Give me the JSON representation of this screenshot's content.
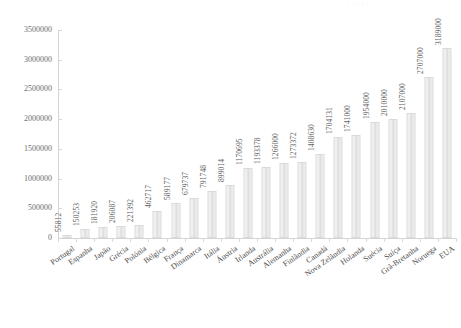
{
  "chart_data": {
    "type": "bar",
    "title": "",
    "xlabel": "",
    "ylabel": "",
    "ylim": [
      0,
      3500000
    ],
    "ytick_values": [
      0,
      500000,
      1000000,
      1500000,
      2000000,
      2500000,
      3000000,
      3500000
    ],
    "ytick_labels": [
      "0",
      "500000",
      "1000000",
      "1500000",
      "2000000",
      "2500000",
      "3000000",
      "3500000"
    ],
    "grid": false,
    "legend": false,
    "data_labels": true,
    "categories": [
      "Portugal",
      "Espanha",
      "Japão",
      "Grécia",
      "Polónia",
      "Bélgica",
      "França",
      "Dinamarca",
      "Itália",
      "Áustria",
      "Irlanda",
      "Austrália",
      "Alemanha",
      "Finlândia",
      "Canadá",
      "Nova Zelândia",
      "Holanda",
      "Suécia",
      "Suíça",
      "Grã-Bretanha",
      "Noruega",
      "EUA"
    ],
    "values": [
      55812,
      150253,
      181920,
      206087,
      221392,
      462717,
      589177,
      679737,
      791748,
      899014,
      1170695,
      1193378,
      1266000,
      1273372,
      1408630,
      1704131,
      1741000,
      1954000,
      2010000,
      2107000,
      2707000,
      3189000
    ],
    "value_labels": [
      "55812",
      "150253",
      "181920",
      "206087",
      "221392",
      "462717",
      "589177",
      "679737",
      "791748",
      "899014",
      "1170695",
      "1193378",
      "1266000",
      "1273372",
      "1408630",
      "1704131",
      "1741000",
      "1954000",
      "2010000",
      "2107000",
      "2707000",
      "3189000"
    ],
    "bar_color": "#e6e6e6",
    "bar_border_color": "#dadada",
    "axis_color": "#d4d4d4",
    "text_color": "#595959"
  },
  "title_remnant": "· · · · · ·"
}
